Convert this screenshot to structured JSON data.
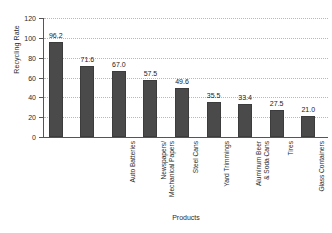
{
  "chart_data": {
    "type": "bar",
    "title": "",
    "xlabel": "Products",
    "ylabel": "Recycling Rate",
    "ylim": [
      0,
      120
    ],
    "ytick_step": 20,
    "yticks": [
      0,
      20,
      40,
      60,
      80,
      100,
      120
    ],
    "grid": true,
    "legend": "none",
    "bar_color": "#4a4a4a",
    "gridline_color": "#b9b9b9",
    "axis_color": "#555555",
    "categories": [
      "Auto Batteries",
      "Newspapers/\nMechanical Papers",
      "Steel Cans",
      "Yard Trimmings",
      "Aluminum Beer\n& Soda Cans",
      "Tires",
      "Glass Containers",
      "HDPE Natural\n(White Translucents)\nBottles",
      "PET Bottles & Jars"
    ],
    "values": [
      96.2,
      71.6,
      67.0,
      57.5,
      49.6,
      35.5,
      33.4,
      27.5,
      21.0
    ],
    "value_labels": [
      "96.2",
      "71.6",
      "67.0",
      "57.5",
      "49.6",
      "35.5",
      "33.4",
      "27.5",
      "21.0"
    ]
  }
}
